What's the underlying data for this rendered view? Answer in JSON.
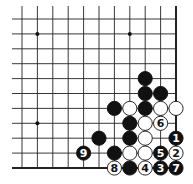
{
  "diagram": {
    "grid": {
      "cols": 11,
      "rows": 11,
      "x0": 22,
      "y0": 19,
      "dx": 15.4,
      "dy": 14.9,
      "left_extend": 12,
      "edges": [
        "right",
        "bottom"
      ]
    },
    "star_points": [
      [
        1,
        1
      ],
      [
        7,
        1
      ],
      [
        1,
        7
      ]
    ],
    "stones": [
      {
        "c": 8,
        "r": 4,
        "color": "black",
        "label": ""
      },
      {
        "c": 8,
        "r": 5,
        "color": "black",
        "label": ""
      },
      {
        "c": 9,
        "r": 5,
        "color": "black",
        "label": ""
      },
      {
        "c": 6,
        "r": 6,
        "color": "black",
        "label": ""
      },
      {
        "c": 7,
        "r": 6,
        "color": "white",
        "label": ""
      },
      {
        "c": 8,
        "r": 6,
        "color": "black",
        "label": ""
      },
      {
        "c": 9,
        "r": 6,
        "color": "white",
        "label": ""
      },
      {
        "c": 10,
        "r": 6,
        "color": "white",
        "label": ""
      },
      {
        "c": 7,
        "r": 7,
        "color": "black",
        "label": ""
      },
      {
        "c": 8,
        "r": 7,
        "color": "white",
        "label": ""
      },
      {
        "c": 9,
        "r": 7,
        "color": "white",
        "label": "6"
      },
      {
        "c": 5,
        "r": 8,
        "color": "black",
        "label": ""
      },
      {
        "c": 7,
        "r": 8,
        "color": "black",
        "label": ""
      },
      {
        "c": 8,
        "r": 8,
        "color": "white",
        "label": ""
      },
      {
        "c": 10,
        "r": 8,
        "color": "black",
        "label": "1"
      },
      {
        "c": 4,
        "r": 9,
        "color": "black",
        "label": "9"
      },
      {
        "c": 6,
        "r": 9,
        "color": "black",
        "label": ""
      },
      {
        "c": 7,
        "r": 9,
        "color": "white",
        "label": ""
      },
      {
        "c": 8,
        "r": 9,
        "color": "white",
        "label": ""
      },
      {
        "c": 9,
        "r": 9,
        "color": "black",
        "label": "5"
      },
      {
        "c": 10,
        "r": 9,
        "color": "white",
        "label": "2"
      },
      {
        "c": 6,
        "r": 10,
        "color": "white",
        "label": "8"
      },
      {
        "c": 7,
        "r": 10,
        "color": "black",
        "label": ""
      },
      {
        "c": 8,
        "r": 10,
        "color": "white",
        "label": "4"
      },
      {
        "c": 9,
        "r": 10,
        "color": "black",
        "label": "3"
      },
      {
        "c": 10,
        "r": 10,
        "color": "black",
        "label": "7"
      }
    ]
  }
}
